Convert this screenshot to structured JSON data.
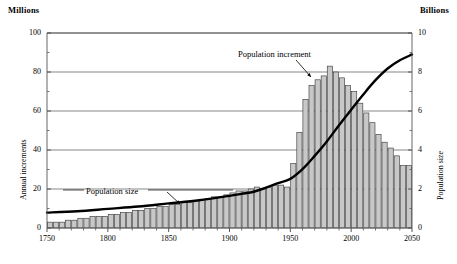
{
  "header": {
    "left_unit": "Millions",
    "right_unit": "Billions"
  },
  "axes": {
    "left_title": "Annual increments",
    "right_title": "Population size",
    "left_ticks": [
      "0",
      "20",
      "40",
      "60",
      "80",
      "100"
    ],
    "right_ticks": [
      "0",
      "2",
      "4",
      "6",
      "8",
      "10"
    ],
    "x_ticks": [
      "1750",
      "1800",
      "1850",
      "1900",
      "1950",
      "2000",
      "2050"
    ]
  },
  "annotations": {
    "increment": "Population increment",
    "size": "Population size"
  },
  "colors": {
    "bar_fill": "#c8c8c8",
    "bar_stroke": "#333333",
    "line": "#000000",
    "grid": "#555555",
    "axis": "#555555",
    "background": "#ffffff"
  },
  "chart_data": {
    "type": "bar",
    "title": "",
    "xlabel": "",
    "ylabel": "Annual increments",
    "y2label": "Population size",
    "ylim": [
      0,
      100
    ],
    "y2lim": [
      0,
      10
    ],
    "xlim": [
      1750,
      2050
    ],
    "grid": true,
    "legend": "none",
    "series": [
      {
        "name": "Population increment",
        "kind": "bar",
        "axis": "left",
        "unit": "Millions",
        "x": [
          1750,
          1755,
          1760,
          1765,
          1770,
          1775,
          1780,
          1785,
          1790,
          1795,
          1800,
          1805,
          1810,
          1815,
          1820,
          1825,
          1830,
          1835,
          1840,
          1845,
          1850,
          1855,
          1860,
          1865,
          1870,
          1875,
          1880,
          1885,
          1890,
          1895,
          1900,
          1905,
          1910,
          1915,
          1920,
          1925,
          1930,
          1935,
          1940,
          1945,
          1950,
          1955,
          1960,
          1965,
          1970,
          1975,
          1980,
          1985,
          1990,
          1995,
          2000,
          2005,
          2010,
          2015,
          2020,
          2025,
          2030,
          2035,
          2040,
          2045
        ],
        "values": [
          3,
          3,
          3,
          4,
          4,
          5,
          5,
          6,
          6,
          6,
          7,
          7,
          8,
          8,
          9,
          9,
          10,
          10,
          11,
          11,
          12,
          12,
          13,
          13,
          14,
          14,
          15,
          16,
          16,
          17,
          18,
          19,
          19,
          20,
          21,
          20,
          21,
          22,
          22,
          21,
          33,
          49,
          66,
          73,
          76,
          78,
          83,
          80,
          77,
          73,
          70,
          64,
          59,
          54,
          48,
          44,
          41,
          37,
          32,
          32
        ]
      },
      {
        "name": "Population size",
        "kind": "line",
        "axis": "right",
        "unit": "Billions",
        "x": [
          1750,
          1775,
          1800,
          1825,
          1850,
          1875,
          1900,
          1910,
          1920,
          1930,
          1940,
          1950,
          1960,
          1970,
          1980,
          1990,
          2000,
          2010,
          2020,
          2030,
          2040,
          2050
        ],
        "values": [
          0.79,
          0.86,
          0.98,
          1.1,
          1.26,
          1.42,
          1.65,
          1.75,
          1.86,
          2.07,
          2.3,
          2.52,
          3.02,
          3.7,
          4.44,
          5.27,
          6.07,
          6.85,
          7.58,
          8.18,
          8.6,
          8.9
        ]
      }
    ]
  }
}
